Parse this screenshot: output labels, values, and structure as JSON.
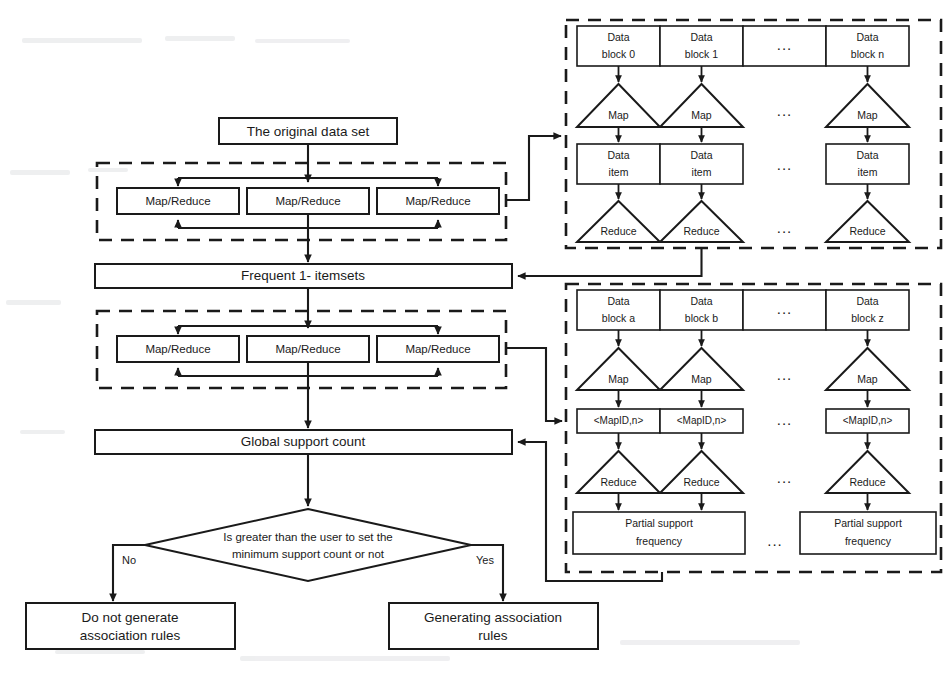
{
  "meta": {
    "stroke_color": "#1a1a1a",
    "background_color": "#ffffff",
    "ellipsis": "..."
  },
  "left_flow": {
    "source_box": {
      "label": "The original data set"
    },
    "group1": {
      "name": "first-mapreduce-group",
      "nodes": [
        {
          "label": "Map/Reduce"
        },
        {
          "label": "Map/Reduce"
        },
        {
          "label": "Map/Reduce"
        }
      ]
    },
    "frequent_itemsets_box": {
      "label": "Frequent 1- itemsets"
    },
    "group2": {
      "name": "second-mapreduce-group",
      "nodes": [
        {
          "label": "Map/Reduce"
        },
        {
          "label": "Map/Reduce"
        },
        {
          "label": "Map/Reduce"
        }
      ]
    },
    "global_support_box": {
      "label": "Global support count"
    },
    "decision": {
      "line1": "Is greater than the user to set the",
      "line2": "minimum support count or not",
      "branch_no": "No",
      "branch_yes": "Yes"
    },
    "outcome_no": {
      "line1": "Do not generate",
      "line2": "association rules"
    },
    "outcome_yes": {
      "line1": "Generating association",
      "line2": "rules"
    }
  },
  "top_right_panel": {
    "name": "first-mapreduce-detail",
    "data_blocks": [
      {
        "line1": "Data",
        "line2": "block 0"
      },
      {
        "line1": "Data",
        "line2": "block 1"
      },
      {
        "line1": "",
        "line2": "..."
      },
      {
        "line1": "Data",
        "line2": "block n"
      }
    ],
    "map_stage": [
      {
        "label": "Map"
      },
      {
        "label": "Map"
      },
      {
        "label": "..."
      },
      {
        "label": "Map"
      }
    ],
    "data_items": [
      {
        "line1": "Data",
        "line2": "item"
      },
      {
        "line1": "Data",
        "line2": "item"
      },
      {
        "line1": "",
        "line2": "..."
      },
      {
        "line1": "Data",
        "line2": "item"
      }
    ],
    "reduce_stage": [
      {
        "label": "Reduce"
      },
      {
        "label": "Reduce"
      },
      {
        "label": "..."
      },
      {
        "label": "Reduce"
      }
    ]
  },
  "bottom_right_panel": {
    "name": "second-mapreduce-detail",
    "data_blocks": [
      {
        "line1": "Data",
        "line2": "block a"
      },
      {
        "line1": "Data",
        "line2": "block b"
      },
      {
        "line1": "",
        "line2": "..."
      },
      {
        "line1": "Data",
        "line2": "block z"
      }
    ],
    "map_stage": [
      {
        "label": "Map"
      },
      {
        "label": "Map"
      },
      {
        "label": "..."
      },
      {
        "label": "Map"
      }
    ],
    "mapid_boxes": [
      {
        "label": "<MapID,n>"
      },
      {
        "label": "<MapID,n>"
      },
      {
        "label": "..."
      },
      {
        "label": "<MapID,n>"
      }
    ],
    "reduce_stage": [
      {
        "label": "Reduce"
      },
      {
        "label": "Reduce"
      },
      {
        "label": "..."
      },
      {
        "label": "Reduce"
      }
    ],
    "partial_results": [
      {
        "line1": "Partial support",
        "line2": "frequency"
      },
      {
        "line1": "...",
        "line2": ""
      },
      {
        "line1": "Partial support",
        "line2": "frequency"
      }
    ]
  }
}
